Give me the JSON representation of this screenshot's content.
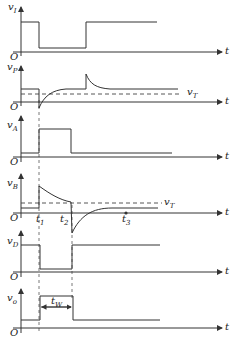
{
  "diagram": {
    "title": "",
    "time_axis_label": "t",
    "origin_label": "O",
    "threshold_label": "v",
    "threshold_sub": "T",
    "pulse_width_label": "t",
    "pulse_width_sub": "W",
    "time_markers": [
      {
        "label": "t",
        "sub": "1"
      },
      {
        "label": "t",
        "sub": "2"
      },
      {
        "label": "t",
        "sub": "3"
      }
    ],
    "panels": [
      {
        "id": "vI",
        "label": "v",
        "sub": "I",
        "description": "input trigger: high, drops low at t1, returns high later"
      },
      {
        "id": "vP",
        "label": "v",
        "sub": "P",
        "description": "differentiated input: negative spike at t1 recovering toward steady level above vT, positive spike when input returns high"
      },
      {
        "id": "vA",
        "label": "v",
        "sub": "A",
        "description": "gate output A: high pulse from t1 to t2"
      },
      {
        "id": "vB",
        "label": "v",
        "sub": "B",
        "description": "RC node: jumps up at t1, decays to vT at t2, drops negative and recovers by t3"
      },
      {
        "id": "vD",
        "label": "v",
        "sub": "D",
        "description": "gate output D: low from t1 to t2, high otherwise"
      },
      {
        "id": "vo",
        "label": "v",
        "sub": "o",
        "description": "output pulse: high from t1 to t2 with width tW"
      }
    ],
    "colors": {
      "line": "#333333",
      "dash": "#444444",
      "background": "#ffffff"
    }
  }
}
